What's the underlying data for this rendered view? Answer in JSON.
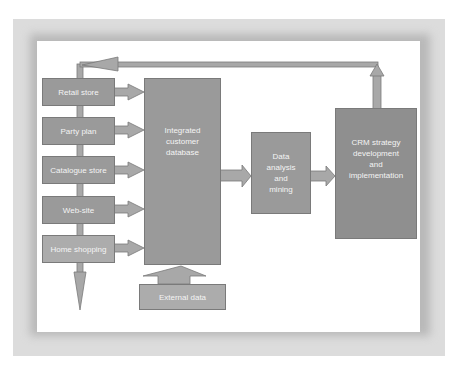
{
  "diagram": {
    "colors": {
      "box_fill": "#9a9a9a",
      "box_fill_light": "#acacac",
      "arrow_fill": "#a8a8a8",
      "arrow_stroke": "#7a7a7a",
      "panel": "#ffffff",
      "frame": "#dcdcdc"
    },
    "channels": [
      {
        "label": "Retail store"
      },
      {
        "label": "Party plan"
      },
      {
        "label": "Catalogue store"
      },
      {
        "label": "Web-site"
      },
      {
        "label": "Home shopping"
      }
    ],
    "database": {
      "label": "Integrated\ncustomer\ndatabase"
    },
    "external": {
      "label": "External data"
    },
    "analysis": {
      "label": "Data\nanalysis\nand\nmining"
    },
    "crm": {
      "label": "CRM strategy\ndevelopment\nand\nimplementation"
    }
  }
}
